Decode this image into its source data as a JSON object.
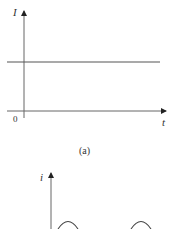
{
  "figure_a": {
    "y_label": "I",
    "x_label": "t",
    "origin_label": "0",
    "caption": "(a)",
    "series": {
      "type": "constant",
      "level_y_px": 62
    }
  },
  "figure_b": {
    "y_label": "i",
    "series": {
      "type": "periodic-arcs",
      "visible_peaks": 2
    }
  },
  "colors": {
    "axis": "#555555",
    "line": "#555555",
    "background": "#ffffff"
  }
}
